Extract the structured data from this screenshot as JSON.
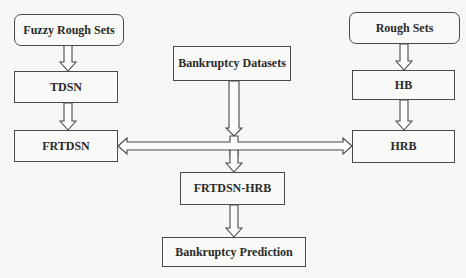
{
  "diagram": {
    "type": "flowchart",
    "nodes": [
      {
        "id": "fuzzy_rough_sets",
        "label": "Fuzzy Rough Sets",
        "shape": "rounded"
      },
      {
        "id": "tdsn",
        "label": "TDSN",
        "shape": "rect"
      },
      {
        "id": "frtdsn",
        "label": "FRTDSN",
        "shape": "rect"
      },
      {
        "id": "bankruptcy_datasets",
        "label": "Bankruptcy Datasets",
        "shape": "rect"
      },
      {
        "id": "rough_sets",
        "label": "Rough Sets",
        "shape": "rounded"
      },
      {
        "id": "hb",
        "label": "HB",
        "shape": "rect"
      },
      {
        "id": "hrb",
        "label": "HRB",
        "shape": "rect"
      },
      {
        "id": "frtdsn_hrb",
        "label": "FRTDSN-HRB",
        "shape": "rect"
      },
      {
        "id": "bankruptcy_prediction",
        "label": "Bankruptcy Prediction",
        "shape": "rect"
      }
    ],
    "edges": [
      {
        "from": "fuzzy_rough_sets",
        "to": "tdsn"
      },
      {
        "from": "tdsn",
        "to": "frtdsn"
      },
      {
        "from": "rough_sets",
        "to": "hb"
      },
      {
        "from": "hb",
        "to": "hrb"
      },
      {
        "from": "bankruptcy_datasets",
        "to": "frtdsn"
      },
      {
        "from": "bankruptcy_datasets",
        "to": "hrb"
      },
      {
        "from": "bankruptcy_datasets",
        "to": "frtdsn_hrb"
      },
      {
        "from": "frtdsn",
        "to": "hrb",
        "bidirectional": true
      },
      {
        "from": "frtdsn_hrb",
        "to": "bankruptcy_prediction"
      }
    ]
  },
  "colors": {
    "stroke": "#4a4a4a",
    "fill": "#f9f9f7",
    "background": "#f7f7f5"
  }
}
